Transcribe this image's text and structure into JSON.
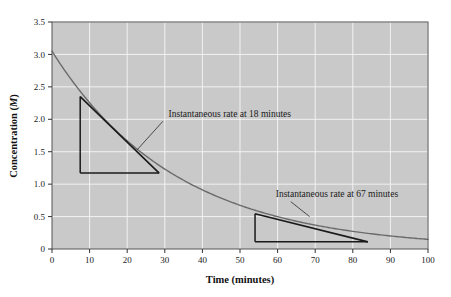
{
  "chart_data": {
    "type": "line",
    "title": "",
    "xlabel": "Time (minutes)",
    "ylabel": "Concentration (M)",
    "ylabel_unit_italic": "M",
    "xlim": [
      0,
      100
    ],
    "ylim": [
      0,
      3.5
    ],
    "grid": true,
    "grid_color": "#f2f2f2",
    "plot_background": "#c9c9c9",
    "page_background": "#ffffff",
    "curve_color": "#6b6b6b",
    "tangent_color": "#1a1a1a",
    "xticks": [
      0,
      10,
      20,
      30,
      40,
      50,
      60,
      70,
      80,
      90,
      100
    ],
    "xtick_labels": [
      "0",
      "10",
      "20",
      "30",
      "40",
      "50",
      "60",
      "70",
      "80",
      "90",
      "100"
    ],
    "yticks": [
      0,
      0.5,
      1.0,
      1.5,
      2.0,
      2.5,
      3.0,
      3.5
    ],
    "ytick_labels": [
      "0",
      "0.5",
      "1.0",
      "1.5",
      "2.0",
      "2.5",
      "3.0",
      "3.5"
    ],
    "series": [
      {
        "name": "Concentration decay",
        "model": "first-order exponential decay",
        "initial_concentration": 3.05,
        "rate_constant": 0.0302,
        "x": [
          0,
          5,
          10,
          15,
          18,
          20,
          25,
          30,
          35,
          40,
          45,
          50,
          55,
          60,
          65,
          67,
          70,
          75,
          80,
          85,
          90,
          95,
          100
        ],
        "y": [
          3.05,
          2.62,
          2.25,
          1.94,
          1.77,
          1.67,
          1.43,
          1.23,
          1.06,
          0.91,
          0.78,
          0.67,
          0.58,
          0.5,
          0.43,
          0.4,
          0.37,
          0.32,
          0.27,
          0.23,
          0.2,
          0.17,
          0.15
        ]
      }
    ],
    "annotations": [
      {
        "id": "tangent-18",
        "label": "Instantaneous rate at 18 minutes",
        "tangent_point_x": 18,
        "tangent_point_y": 1.77,
        "triangle": {
          "apex_x": 7.5,
          "apex_y": 2.35,
          "corner_x": 7.5,
          "corner_y": 1.17,
          "base_end_x": 28.5,
          "base_end_y": 1.17
        },
        "label_x": 31,
        "label_y": 2.03,
        "leader_from_x": 29.5,
        "leader_from_y": 1.97,
        "leader_to_x": 22.5,
        "leader_to_y": 1.52
      },
      {
        "id": "tangent-67",
        "label": "Instantaneous rate at 67 minutes",
        "tangent_point_x": 67,
        "tangent_point_y": 0.4,
        "triangle": {
          "apex_x": 54,
          "apex_y": 0.545,
          "corner_x": 54,
          "corner_y": 0.11,
          "base_end_x": 84,
          "base_end_y": 0.11
        },
        "label_x": 59.5,
        "label_y": 0.8,
        "leader_from_x": 63.5,
        "leader_from_y": 0.73,
        "leader_to_x": 68.5,
        "leader_to_y": 0.5
      }
    ]
  }
}
